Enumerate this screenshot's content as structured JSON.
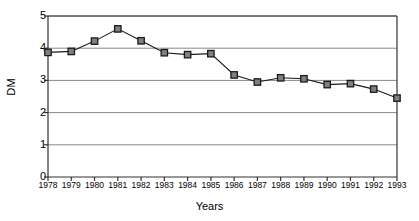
{
  "chart_data": {
    "type": "line",
    "title": "",
    "xlabel": "Years",
    "ylabel": "DM",
    "categories": [
      "1978",
      "1979",
      "1980",
      "1981",
      "1982",
      "1983",
      "1984",
      "1985",
      "1986",
      "1987",
      "1988",
      "1989",
      "1990",
      "1991",
      "1992",
      "1993"
    ],
    "values": [
      3.87,
      3.9,
      4.22,
      4.6,
      4.23,
      3.86,
      3.8,
      3.83,
      3.17,
      2.95,
      3.08,
      3.05,
      2.87,
      2.9,
      2.73,
      2.45
    ],
    "ylim": [
      0,
      5
    ],
    "yticks": [
      "0",
      "1",
      "2",
      "3",
      "4",
      "5"
    ],
    "ytick_values": [
      0,
      1,
      2,
      3,
      4,
      5
    ],
    "grid": true,
    "grid_axis": "y",
    "legend": "none",
    "marker": "square",
    "marker_color": "#808080",
    "marker_edge_color": "#1a1a1a",
    "line_color": "#1a1a1a",
    "grid_color": "#888888",
    "axis_color": "#333333",
    "background": "#ffffff"
  },
  "axis": {
    "y_title": "DM",
    "x_title": "Years"
  }
}
